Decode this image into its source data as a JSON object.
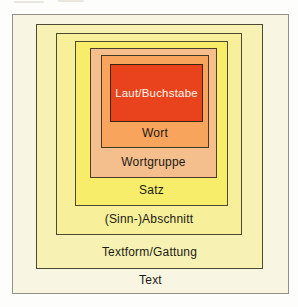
{
  "diagram": {
    "levels": [
      {
        "label": "Text",
        "fill": "#f8f6e3",
        "text_color": "#1d1b15"
      },
      {
        "label": "Textform/Gattung",
        "fill": "#f7f2b3",
        "text_color": "#1d1b15"
      },
      {
        "label": "(Sinn-)Abschnitt",
        "fill": "#f7ef9a",
        "text_color": "#1d1b15"
      },
      {
        "label": "Satz",
        "fill": "#f8ed6b",
        "text_color": "#1d1b15"
      },
      {
        "label": "Wortgruppe",
        "fill": "#f4bf8d",
        "text_color": "#1d1b15"
      },
      {
        "label": "Wort",
        "fill": "#f9a45c",
        "text_color": "#1d1b15"
      },
      {
        "label": "Laut/Buchstabe",
        "fill": "#e8431c",
        "text_color": "#fff7ef"
      }
    ],
    "border_color_inner": "#4c4a33",
    "border_color_outer": "#91928a"
  }
}
